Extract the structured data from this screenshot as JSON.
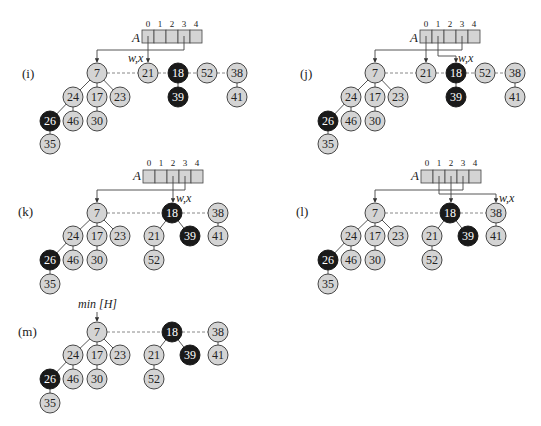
{
  "figure": {
    "array_label": "A",
    "array_indices": [
      "0",
      "1",
      "2",
      "3",
      "4"
    ],
    "pointer_label": "w,x",
    "min_label": "min [H]",
    "colors": {
      "light_node": "#d4d4d4",
      "dark_node": "#1a1a1a",
      "array_cell": "#d4d4d4"
    }
  },
  "panels": [
    {
      "label": "(i)",
      "roots": [
        "7",
        "21",
        "18",
        "52",
        "38"
      ],
      "pointer_at": "21",
      "array_pointers": {
        "0": "21",
        "3": "7"
      },
      "nodes": [
        {
          "key": "7",
          "color": "light"
        },
        {
          "key": "21",
          "color": "light"
        },
        {
          "key": "18",
          "color": "dark"
        },
        {
          "key": "52",
          "color": "light"
        },
        {
          "key": "38",
          "color": "light"
        },
        {
          "key": "24",
          "color": "light"
        },
        {
          "key": "17",
          "color": "light"
        },
        {
          "key": "23",
          "color": "light"
        },
        {
          "key": "26",
          "color": "dark"
        },
        {
          "key": "46",
          "color": "light"
        },
        {
          "key": "30",
          "color": "light"
        },
        {
          "key": "35",
          "color": "light"
        },
        {
          "key": "39",
          "color": "dark"
        },
        {
          "key": "41",
          "color": "light"
        }
      ]
    },
    {
      "label": "(j)",
      "roots": [
        "7",
        "21",
        "18",
        "52",
        "38"
      ],
      "pointer_at": "18",
      "array_pointers": {
        "0": "21",
        "1": "18",
        "3": "7"
      },
      "nodes": [
        {
          "key": "7",
          "color": "light"
        },
        {
          "key": "21",
          "color": "light"
        },
        {
          "key": "18",
          "color": "dark"
        },
        {
          "key": "52",
          "color": "light"
        },
        {
          "key": "38",
          "color": "light"
        },
        {
          "key": "24",
          "color": "light"
        },
        {
          "key": "17",
          "color": "light"
        },
        {
          "key": "23",
          "color": "light"
        },
        {
          "key": "26",
          "color": "dark"
        },
        {
          "key": "46",
          "color": "light"
        },
        {
          "key": "30",
          "color": "light"
        },
        {
          "key": "35",
          "color": "light"
        },
        {
          "key": "39",
          "color": "dark"
        },
        {
          "key": "41",
          "color": "light"
        }
      ]
    },
    {
      "label": "(k)",
      "roots": [
        "7",
        "18",
        "38"
      ],
      "pointer_at": "18",
      "array_pointers": {
        "2": "18",
        "3": "7"
      },
      "nodes": [
        {
          "key": "7",
          "color": "light"
        },
        {
          "key": "18",
          "color": "dark"
        },
        {
          "key": "38",
          "color": "light"
        },
        {
          "key": "24",
          "color": "light"
        },
        {
          "key": "17",
          "color": "light"
        },
        {
          "key": "23",
          "color": "light"
        },
        {
          "key": "26",
          "color": "dark"
        },
        {
          "key": "46",
          "color": "light"
        },
        {
          "key": "30",
          "color": "light"
        },
        {
          "key": "35",
          "color": "light"
        },
        {
          "key": "21",
          "color": "light"
        },
        {
          "key": "39",
          "color": "dark"
        },
        {
          "key": "52",
          "color": "light"
        },
        {
          "key": "41",
          "color": "light"
        }
      ]
    },
    {
      "label": "(l)",
      "roots": [
        "7",
        "18",
        "38"
      ],
      "pointer_at": "38",
      "array_pointers": {
        "1": "38",
        "2": "18",
        "3": "7"
      },
      "nodes": [
        {
          "key": "7",
          "color": "light"
        },
        {
          "key": "18",
          "color": "dark"
        },
        {
          "key": "38",
          "color": "light"
        },
        {
          "key": "24",
          "color": "light"
        },
        {
          "key": "17",
          "color": "light"
        },
        {
          "key": "23",
          "color": "light"
        },
        {
          "key": "26",
          "color": "dark"
        },
        {
          "key": "46",
          "color": "light"
        },
        {
          "key": "30",
          "color": "light"
        },
        {
          "key": "35",
          "color": "light"
        },
        {
          "key": "21",
          "color": "light"
        },
        {
          "key": "39",
          "color": "dark"
        },
        {
          "key": "52",
          "color": "light"
        },
        {
          "key": "41",
          "color": "light"
        }
      ]
    },
    {
      "label": "(m)",
      "roots": [
        "7",
        "18",
        "38"
      ],
      "min_at": "7",
      "nodes": [
        {
          "key": "7",
          "color": "light"
        },
        {
          "key": "18",
          "color": "dark"
        },
        {
          "key": "38",
          "color": "light"
        },
        {
          "key": "24",
          "color": "light"
        },
        {
          "key": "17",
          "color": "light"
        },
        {
          "key": "23",
          "color": "light"
        },
        {
          "key": "26",
          "color": "dark"
        },
        {
          "key": "46",
          "color": "light"
        },
        {
          "key": "30",
          "color": "light"
        },
        {
          "key": "35",
          "color": "light"
        },
        {
          "key": "21",
          "color": "light"
        },
        {
          "key": "39",
          "color": "dark"
        },
        {
          "key": "52",
          "color": "light"
        },
        {
          "key": "41",
          "color": "light"
        }
      ]
    }
  ]
}
